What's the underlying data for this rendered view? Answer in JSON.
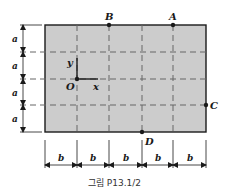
{
  "figure": {
    "caption": "그림 P13.1/2",
    "plate_fill": "#cccccc",
    "line_color": "#1a1a1a",
    "grid_color": "#666666"
  },
  "points": {
    "A": "A",
    "B": "B",
    "C": "C",
    "D": "D",
    "O": "O"
  },
  "axes": {
    "x": "x",
    "y": "y"
  },
  "dimensions": {
    "vertical": [
      "a",
      "a",
      "a",
      "a"
    ],
    "horizontal": [
      "b",
      "b",
      "b",
      "b",
      "b"
    ]
  }
}
